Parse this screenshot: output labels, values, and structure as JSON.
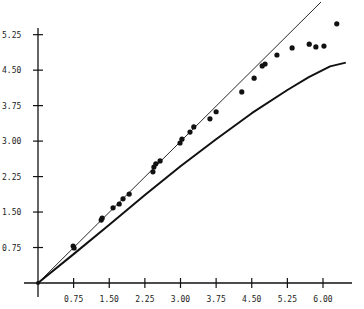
{
  "chart_data": {
    "type": "scatter",
    "title": "",
    "xlabel": "",
    "ylabel": "",
    "xlim": [
      0,
      6.6
    ],
    "ylim": [
      0,
      5.9
    ],
    "grid": false,
    "legend": null,
    "x_ticks": [
      "0.75",
      "1.50",
      "2.25",
      "3.00",
      "3.75",
      "4.50",
      "5.25",
      "6.00"
    ],
    "y_ticks": [
      "0.75",
      "1.50",
      "2.25",
      "3.00",
      "3.75",
      "4.50",
      "5.25"
    ],
    "series": [
      {
        "name": "observed points",
        "type": "scatter",
        "points": [
          [
            0.74,
            0.78
          ],
          [
            0.76,
            0.74
          ],
          [
            1.33,
            1.33
          ],
          [
            1.35,
            1.37
          ],
          [
            1.58,
            1.59
          ],
          [
            1.71,
            1.67
          ],
          [
            1.79,
            1.78
          ],
          [
            1.92,
            1.88
          ],
          [
            2.42,
            2.35
          ],
          [
            2.44,
            2.45
          ],
          [
            2.48,
            2.52
          ],
          [
            2.57,
            2.58
          ],
          [
            2.99,
            2.96
          ],
          [
            3.03,
            3.04
          ],
          [
            3.2,
            3.19
          ],
          [
            3.28,
            3.3
          ],
          [
            3.62,
            3.47
          ],
          [
            3.75,
            3.62
          ],
          [
            4.29,
            4.04
          ],
          [
            4.55,
            4.33
          ],
          [
            4.72,
            4.59
          ],
          [
            4.78,
            4.63
          ],
          [
            5.03,
            4.82
          ],
          [
            5.35,
            4.97
          ],
          [
            5.71,
            5.05
          ],
          [
            5.85,
            4.99
          ],
          [
            6.02,
            5.01
          ],
          [
            6.29,
            5.48
          ]
        ]
      },
      {
        "name": "identity line (thin)",
        "type": "line",
        "points": [
          [
            0,
            0
          ],
          [
            6.0,
            5.95
          ]
        ]
      },
      {
        "name": "model curve (thick)",
        "type": "line",
        "points": [
          [
            0,
            0
          ],
          [
            0.75,
            0.61
          ],
          [
            1.5,
            1.23
          ],
          [
            2.25,
            1.86
          ],
          [
            3.0,
            2.47
          ],
          [
            3.75,
            3.04
          ],
          [
            4.5,
            3.59
          ],
          [
            5.25,
            4.08
          ],
          [
            5.7,
            4.35
          ],
          [
            6.15,
            4.58
          ],
          [
            6.48,
            4.66
          ]
        ]
      }
    ]
  }
}
